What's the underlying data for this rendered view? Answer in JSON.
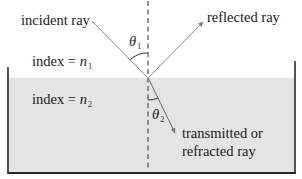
{
  "diagram": {
    "labels": {
      "incident": "incident ray",
      "reflected": "reflected ray",
      "transmitted_line1": "transmitted or",
      "transmitted_line2": "refracted ray",
      "index_top_prefix": "index = ",
      "index_top_var": "n",
      "index_top_sub": "1",
      "index_bottom_prefix": "index = ",
      "index_bottom_var": "n",
      "index_bottom_sub": "2",
      "theta1_symbol": "θ",
      "theta1_sub": "1",
      "theta2_symbol": "θ",
      "theta2_sub": "2"
    },
    "colors": {
      "medium2_fill": "#e4e4e4",
      "container_stroke": "#2a2a2a",
      "ray_stroke": "#8a8a8a",
      "normal_stroke": "#333333",
      "text": "#1a1a1a"
    }
  }
}
